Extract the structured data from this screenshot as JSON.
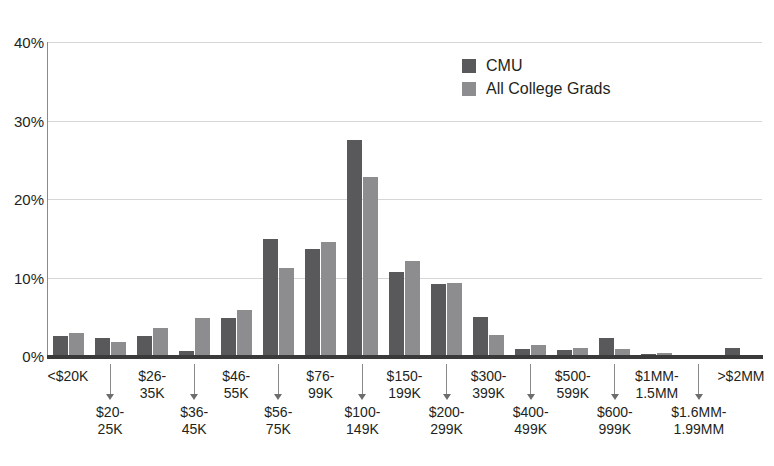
{
  "chart_data": {
    "type": "bar",
    "title": "",
    "subtitle": "",
    "xlabel": "",
    "ylabel": "",
    "ylim": [
      0,
      40
    ],
    "yticks": [
      "0%",
      "10%",
      "20%",
      "30%",
      "40%"
    ],
    "ytick_values": [
      0,
      10,
      20,
      30,
      40
    ],
    "grid": true,
    "legend_position": "top-center-right",
    "categories": [
      "<$20K",
      "$20-\n25K",
      "$26-\n35K",
      "$36-\n45K",
      "$46-\n55K",
      "$56-\n75K",
      "$76-\n99K",
      "$100-\n149K",
      "$150-\n199K",
      "$200-\n299K",
      "$300-\n399K",
      "$400-\n499K",
      "$500-\n599K",
      "$600-\n999K",
      "$1MM-\n1.5MM",
      "$1.6MM-\n1.99MM",
      ">$2MM"
    ],
    "series": [
      {
        "name": "CMU",
        "color": "#59595b",
        "values": [
          2.6,
          2.3,
          2.6,
          0.6,
          4.8,
          14.9,
          13.6,
          27.5,
          10.7,
          9.2,
          5.0,
          0.9,
          0.8,
          2.3,
          0.2,
          0.1,
          1.0
        ]
      },
      {
        "name": "All College Grads",
        "color": "#8d8d8f",
        "values": [
          2.9,
          1.8,
          3.6,
          4.9,
          5.9,
          11.2,
          14.5,
          22.8,
          12.1,
          9.3,
          2.7,
          1.4,
          1.0,
          0.9,
          0.4,
          0.1,
          0.15
        ]
      }
    ]
  },
  "legend": {
    "items": [
      {
        "label": "CMU",
        "color": "#59595b"
      },
      {
        "label": "All College Grads",
        "color": "#8d8d8f"
      }
    ]
  },
  "axis": {
    "y_ticks": [
      "40%",
      "30%",
      "20%",
      "10%",
      "0%"
    ],
    "x_top_row": [
      "<$20K",
      "$26-\n35K",
      "$46-\n55K",
      "$76-\n99K",
      "$150-\n199K",
      "$300-\n399K",
      "$500-\n599K",
      "$1MM-\n1.5MM",
      ">$2MM"
    ],
    "x_bottom_row": [
      "$20-\n25K",
      "$36-\n45K",
      "$56-\n75K",
      "$100-\n149K",
      "$200-\n299K",
      "$400-\n499K",
      "$600-\n999K",
      "$1.6MM-\n1.99MM"
    ]
  }
}
